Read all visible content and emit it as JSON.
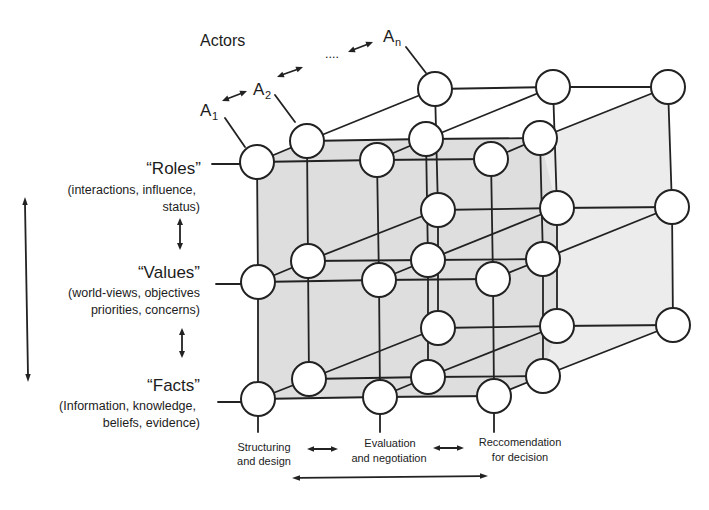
{
  "title": "Actors",
  "actors": [
    {
      "letter": "A",
      "sub": "1"
    },
    {
      "letter": "A",
      "sub": "2"
    },
    {
      "letter": "A",
      "sub": "n"
    }
  ],
  "actors_ellipsis": "....",
  "dimensions": [
    {
      "label": "“Roles”",
      "desc": [
        "(interactions, influence,",
        "status)"
      ]
    },
    {
      "label": "“Values”",
      "desc": [
        "(world-views, objectives",
        "priorities, concerns)"
      ]
    },
    {
      "label": "“Facts”",
      "desc": [
        "(Information, knowledge,",
        "beliefs, evidence)"
      ]
    }
  ],
  "phases": [
    {
      "lines": [
        "Structuring",
        "and design"
      ]
    },
    {
      "lines": [
        "Evaluation",
        "and negotiation"
      ]
    },
    {
      "lines": [
        "Reccomendation",
        "for decision"
      ]
    }
  ],
  "grid": {
    "layers": [
      "A1",
      "A2",
      "An"
    ],
    "rows": [
      "Roles",
      "Values",
      "Facts"
    ],
    "columns": [
      "Structuring and design",
      "Evaluation and negotiation",
      "Reccomendation for decision"
    ]
  },
  "colors": {
    "ink": "#222222",
    "shade_dark": "#dedede",
    "shade_light": "#ececec",
    "node_fill": "#ffffff",
    "background": "#ffffff"
  }
}
